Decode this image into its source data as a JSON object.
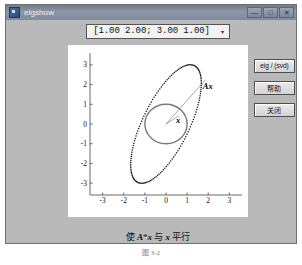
{
  "window": {
    "title": "eigshow",
    "icon": "app-icon",
    "controls": [
      {
        "name": "minimize",
        "glyph": "—"
      },
      {
        "name": "maximize",
        "glyph": "□"
      },
      {
        "name": "close",
        "glyph": "✕"
      }
    ]
  },
  "toolbar": {
    "matrix_value": "[1.00 2.00; 3.00 1.00]",
    "dropdown_arrow": "▾"
  },
  "side_buttons": [
    {
      "name": "eig-svd-toggle",
      "label": "eig / (svd)",
      "cjk": false
    },
    {
      "name": "help-button",
      "label": "帮助",
      "cjk": true
    },
    {
      "name": "close-button",
      "label": "关闭",
      "cjk": true
    }
  ],
  "plot": {
    "caption_prefix": "使 ",
    "caption_a": "A",
    "caption_star": "*",
    "caption_x1": "x",
    "caption_mid": " 与 ",
    "caption_x2": "x",
    "caption_suffix": " 平行",
    "vector_x_label": "x",
    "vector_ax_label": "Ax"
  },
  "figure_caption": "图 3-2",
  "chart_data": {
    "type": "scatter",
    "title": "",
    "xlabel": "",
    "ylabel": "",
    "xlim": [
      -3.6,
      3.6
    ],
    "ylim": [
      -3.6,
      3.6
    ],
    "xticks": [
      -3,
      -2,
      -1,
      0,
      1,
      2,
      3
    ],
    "yticks": [
      -3,
      -2,
      -1,
      0,
      1,
      2,
      3
    ],
    "grid": false,
    "matrix": [
      [
        1.0,
        2.0
      ],
      [
        3.0,
        1.0
      ]
    ],
    "series": [
      {
        "name": "unit circle (x)",
        "description": "Unit circle of radius 1 centered at origin, drawn as a solid gray ring",
        "radius": 1.0,
        "center": [
          0,
          0
        ],
        "color": "#7a7a7a"
      },
      {
        "name": "ellipse (A*x)",
        "description": "Image of the unit circle under A, drawn as dense black dots",
        "semi_major": 3.25,
        "semi_minor": 1.12,
        "rotation_deg": 66,
        "center": [
          0,
          0
        ],
        "color": "#111111"
      }
    ],
    "vectors": [
      {
        "name": "x",
        "from": [
          0,
          0
        ],
        "to": [
          0.62,
          0.42
        ],
        "label": "x",
        "color": "#808080"
      },
      {
        "name": "Ax",
        "from": [
          0,
          0
        ],
        "to": [
          1.88,
          2.25
        ],
        "label": "Ax",
        "color": "#808080"
      }
    ]
  }
}
